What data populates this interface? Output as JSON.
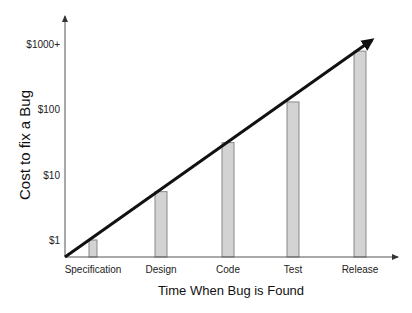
{
  "chart_data": {
    "type": "bar",
    "title": "",
    "xlabel": "Time When Bug is Found",
    "ylabel": "Cost to fix a Bug",
    "yscale": "log",
    "ylim": [
      0.75,
      1500
    ],
    "yticks": [
      {
        "value": 1,
        "label": "$1"
      },
      {
        "value": 10,
        "label": "$10"
      },
      {
        "value": 100,
        "label": "$100"
      },
      {
        "value": 1000,
        "label": "$1000+"
      }
    ],
    "categories": [
      "Specification",
      "Design",
      "Code",
      "Test",
      "Release"
    ],
    "values": [
      1,
      5.5,
      31,
      130,
      780
    ],
    "trend_line": {
      "style": "arrow",
      "from": "origin",
      "to": "above Release",
      "color": "#111111"
    },
    "grid": false,
    "legend": null,
    "colors": {
      "bar_fill": "#d3d3d3",
      "bar_stroke": "#888888",
      "axis": "#555555",
      "trend": "#111111"
    }
  }
}
